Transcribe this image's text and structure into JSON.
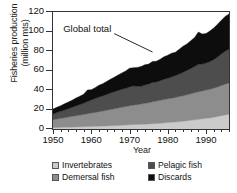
{
  "chart_data": {
    "type": "area",
    "stacked": true,
    "title": "",
    "xlabel": "Year",
    "ylabel_line1": "Fisheries production",
    "ylabel_line2": "(million mts)",
    "xlim": [
      1950,
      1996
    ],
    "ylim": [
      0,
      120
    ],
    "xticks": [
      1950,
      1960,
      1970,
      1980,
      1990
    ],
    "xtick_labels": [
      "1950",
      "1960",
      "1970",
      "1980",
      "1990"
    ],
    "yticks": [
      0,
      20,
      40,
      60,
      80,
      100,
      120
    ],
    "ytick_labels": [
      "0",
      "20",
      "40",
      "60",
      "80",
      "100",
      "120"
    ],
    "grid": false,
    "legend_position": "below",
    "annotations": [
      {
        "text": "Global total",
        "x_data": 1966,
        "y_data": 103,
        "leader_to_x": 1976,
        "leader_to_y": 79
      }
    ],
    "colors": {
      "invertebrates": "#cbcbcb",
      "demersal_fish": "#8d8d8d",
      "pelagic_fish": "#4d4d4d",
      "discards": "#0d0d0d",
      "axis": "#333333",
      "text": "#111111",
      "background": "#ffffff"
    },
    "x": [
      1950,
      1951,
      1952,
      1953,
      1954,
      1955,
      1956,
      1957,
      1958,
      1959,
      1960,
      1961,
      1962,
      1963,
      1964,
      1965,
      1966,
      1967,
      1968,
      1969,
      1970,
      1971,
      1972,
      1973,
      1974,
      1975,
      1976,
      1977,
      1978,
      1979,
      1980,
      1981,
      1982,
      1983,
      1984,
      1985,
      1986,
      1987,
      1988,
      1989,
      1990,
      1991,
      1992,
      1993,
      1994,
      1995,
      1996
    ],
    "series": [
      {
        "name": "Invertebrates",
        "color": "#cbcbcb",
        "values": [
          1.5,
          1.6,
          1.7,
          1.8,
          1.9,
          2.0,
          2.1,
          2.2,
          2.3,
          2.5,
          2.6,
          2.7,
          2.9,
          3.0,
          3.2,
          3.4,
          3.5,
          3.7,
          3.9,
          4.1,
          4.3,
          4.5,
          4.6,
          4.8,
          5.0,
          5.2,
          5.5,
          5.7,
          6.0,
          6.3,
          6.6,
          6.9,
          7.2,
          7.6,
          8.0,
          8.4,
          8.9,
          9.4,
          9.9,
          10.4,
          10.9,
          11.4,
          12.0,
          12.8,
          13.6,
          14.4,
          15.2
        ]
      },
      {
        "name": "Demersal fish",
        "color": "#8d8d8d",
        "values": [
          8.0,
          8.6,
          9.2,
          9.8,
          10.4,
          11.0,
          11.6,
          12.1,
          12.6,
          13.2,
          13.8,
          14.3,
          14.9,
          15.4,
          16.0,
          16.6,
          17.2,
          17.8,
          18.4,
          18.9,
          19.5,
          20.0,
          20.4,
          20.8,
          21.3,
          21.8,
          22.4,
          22.9,
          23.4,
          23.9,
          24.3,
          24.7,
          25.2,
          25.7,
          26.2,
          26.7,
          27.2,
          27.7,
          28.2,
          28.6,
          29.0,
          29.4,
          29.9,
          30.4,
          31.0,
          31.6,
          32.0
        ]
      },
      {
        "name": "Pelagic fish",
        "color": "#4d4d4d",
        "values": [
          6.0,
          6.6,
          7.2,
          7.8,
          8.5,
          9.2,
          10.0,
          10.8,
          11.5,
          12.4,
          13.3,
          14.2,
          15.0,
          15.5,
          16.2,
          16.8,
          17.4,
          18.0,
          18.5,
          18.8,
          19.4,
          19.8,
          18.8,
          18.2,
          18.8,
          19.2,
          19.8,
          19.6,
          20.2,
          20.8,
          21.2,
          21.8,
          22.4,
          23.0,
          24.0,
          25.0,
          26.0,
          27.0,
          28.2,
          27.6,
          27.8,
          28.4,
          29.2,
          30.6,
          32.2,
          33.8,
          34.8
        ]
      },
      {
        "name": "Discards",
        "color": "#0d0d0d",
        "values": [
          5.0,
          5.4,
          5.8,
          6.4,
          6.8,
          7.4,
          8.0,
          8.6,
          9.2,
          12.0,
          10.6,
          11.2,
          12.0,
          12.6,
          13.4,
          14.2,
          15.0,
          15.8,
          16.6,
          17.8,
          19.2,
          18.6,
          19.4,
          20.2,
          20.8,
          20.4,
          21.6,
          21.2,
          22.0,
          23.0,
          23.6,
          24.4,
          24.0,
          25.6,
          26.8,
          27.2,
          28.4,
          29.8,
          33.2,
          30.8,
          30.2,
          31.4,
          32.4,
          33.6,
          34.8,
          35.6,
          36.0
        ]
      }
    ],
    "global_total": [
      20.5,
      22.2,
      23.9,
      25.8,
      27.6,
      29.6,
      31.7,
      33.7,
      35.6,
      42.1,
      40.3,
      42.4,
      44.8,
      46.5,
      48.8,
      51.0,
      53.1,
      55.3,
      57.4,
      59.6,
      62.4,
      62.9,
      63.2,
      64.0,
      65.9,
      66.6,
      69.3,
      69.4,
      71.6,
      74.0,
      75.7,
      77.8,
      78.8,
      81.9,
      85.0,
      87.3,
      90.5,
      93.9,
      99.5,
      97.4,
      97.9,
      100.6,
      103.5,
      107.4,
      111.6,
      115.4,
      118.0
    ],
    "legend": [
      {
        "label": "Invertebrates",
        "color": "#cbcbcb"
      },
      {
        "label": "Pelagic fish",
        "color": "#4d4d4d"
      },
      {
        "label": "Demersal fish",
        "color": "#8d8d8d"
      },
      {
        "label": "Discards",
        "color": "#0d0d0d"
      }
    ]
  }
}
